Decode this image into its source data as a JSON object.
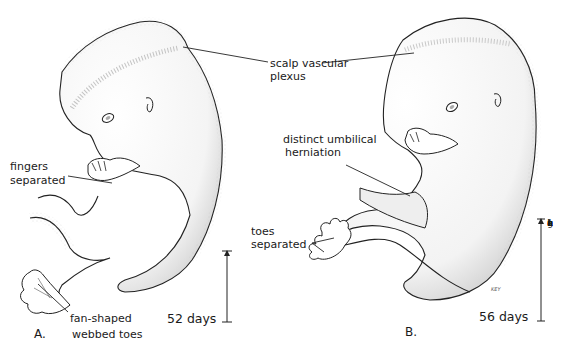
{
  "figure": {
    "panels": [
      {
        "id": "A",
        "panel_label": "A.",
        "age_label": "52 days",
        "labels": {
          "scalp": "scalp vascular\nplexus",
          "fingers_line1": "fingers",
          "fingers_line2": "separated",
          "toes_line1": "fan-shaped",
          "toes_line2": "webbed toes"
        }
      },
      {
        "id": "B",
        "panel_label": "B.",
        "age_label": "56 days",
        "labels": {
          "umbilical_line1": "distinct umbilical",
          "umbilical_line2": "herniation",
          "toes_line1": "toes",
          "toes_line2": "separated"
        },
        "scale_bar_label": [
          "a",
          "c",
          "t",
          "u",
          "a",
          "l",
          "L",
          "e",
          "n",
          "g",
          "t",
          "h"
        ],
        "artist_signature": "KEY"
      }
    ],
    "shared_labels": {
      "scalp_line1": "scalp vascular",
      "scalp_line2": "plexus"
    },
    "colors": {
      "ink": "#1a1a1a",
      "stipple": "#8a8a8a",
      "background": "#ffffff"
    }
  }
}
